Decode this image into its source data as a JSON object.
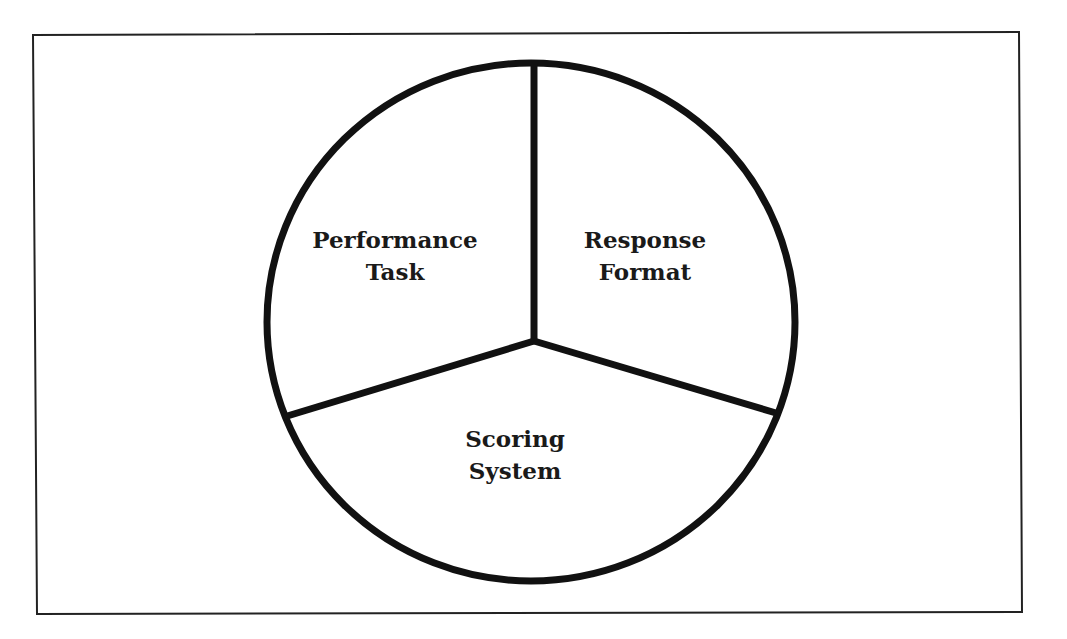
{
  "diagram": {
    "type": "three-part circle",
    "segments": [
      {
        "id": "performance-task",
        "line1": "Performance",
        "line2": "Task"
      },
      {
        "id": "response-format",
        "line1": "Response",
        "line2": "Format"
      },
      {
        "id": "scoring-system",
        "line1": "Scoring",
        "line2": "System"
      }
    ],
    "colors": {
      "stroke": "#111111",
      "background": "#ffffff",
      "text": "#1a1a1a"
    }
  }
}
